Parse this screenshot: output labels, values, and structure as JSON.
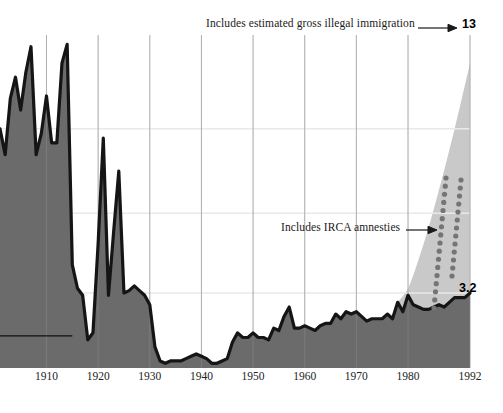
{
  "chart_data": {
    "type": "area",
    "title": "",
    "subtitle": "",
    "xlabel": "",
    "ylabel": "",
    "xlim": [
      1901,
      1992
    ],
    "ylim": [
      0,
      14.2
    ],
    "grid": true,
    "gridlines_y": [
      3.2,
      6.6,
      10.2
    ],
    "legend_position": "none",
    "tick_labels_x": [
      "1910",
      "1920",
      "1930",
      "1940",
      "1950",
      "1960",
      "1970",
      "1980",
      "1992"
    ],
    "tick_values_x": [
      1910,
      1920,
      1930,
      1940,
      1950,
      1960,
      1970,
      1980,
      1992
    ],
    "annotations": [
      {
        "text": "Includes estimated gross illegal immigration",
        "points_to": "13",
        "arrow": "right"
      },
      {
        "text": "Includes IRCA amnesties",
        "points_to": "dotted-band",
        "arrow": "right"
      }
    ],
    "value_labels": [
      {
        "text": "13",
        "series": "total_with_illegal",
        "x": 1992,
        "y": 13
      },
      {
        "text": "3.2",
        "series": "legal_immigration",
        "x": 1992,
        "y": 3.2
      }
    ],
    "series": [
      {
        "name": "legal_immigration",
        "style": "area-dark",
        "fill": "#6b6b6b",
        "stroke": "#151515",
        "x": [
          1901,
          1902,
          1903,
          1904,
          1905,
          1906,
          1907,
          1908,
          1909,
          1910,
          1911,
          1912,
          1913,
          1914,
          1915,
          1916,
          1917,
          1918,
          1919,
          1920,
          1921,
          1922,
          1923,
          1924,
          1925,
          1926,
          1927,
          1928,
          1929,
          1930,
          1931,
          1932,
          1933,
          1934,
          1935,
          1936,
          1937,
          1938,
          1939,
          1940,
          1941,
          1942,
          1943,
          1944,
          1945,
          1946,
          1947,
          1948,
          1949,
          1950,
          1951,
          1952,
          1953,
          1954,
          1955,
          1956,
          1957,
          1958,
          1959,
          1960,
          1961,
          1962,
          1963,
          1964,
          1965,
          1966,
          1967,
          1968,
          1969,
          1970,
          1971,
          1972,
          1973,
          1974,
          1975,
          1976,
          1977,
          1978,
          1979,
          1980,
          1981,
          1982,
          1983,
          1984,
          1985,
          1986,
          1987,
          1988,
          1989,
          1990,
          1991,
          1992
        ],
        "y": [
          10.2,
          9.1,
          11.5,
          12.4,
          11.0,
          12.6,
          13.7,
          9.1,
          10.0,
          11.6,
          9.6,
          9.6,
          13.0,
          13.8,
          4.4,
          3.4,
          3.1,
          1.2,
          1.5,
          5.3,
          9.8,
          3.1,
          5.8,
          8.4,
          3.2,
          3.3,
          3.5,
          3.3,
          3.1,
          2.7,
          0.9,
          0.3,
          0.2,
          0.3,
          0.3,
          0.3,
          0.4,
          0.5,
          0.6,
          0.5,
          0.4,
          0.2,
          0.2,
          0.3,
          0.4,
          1.1,
          1.5,
          1.3,
          1.3,
          1.5,
          1.3,
          1.3,
          1.2,
          1.7,
          1.6,
          2.2,
          2.6,
          1.7,
          1.7,
          1.8,
          1.7,
          1.6,
          1.8,
          1.9,
          1.9,
          2.3,
          2.1,
          2.4,
          2.3,
          2.4,
          2.2,
          2.0,
          2.1,
          2.1,
          2.1,
          2.3,
          2.1,
          2.8,
          2.4,
          3.1,
          2.7,
          2.6,
          2.5,
          2.5,
          2.6,
          2.7,
          2.6,
          2.8,
          3.0,
          3.0,
          3.0,
          3.2
        ]
      },
      {
        "name": "total_with_illegal",
        "style": "area-light-overlay",
        "fill": "#c9c9c9",
        "x": [
          1978,
          1980,
          1982,
          1984,
          1986,
          1988,
          1990,
          1992
        ],
        "y": [
          2.8,
          3.4,
          4.6,
          6.0,
          7.6,
          9.3,
          11.1,
          13.0
        ]
      },
      {
        "name": "irca_amnesty_band",
        "style": "dotted",
        "color": "#757575",
        "dot_radius": 2.6,
        "note": "two dotted tracks inside the light wedge"
      }
    ],
    "reference_line": {
      "name": "left-baseline-rule",
      "y": 3.2,
      "x_from": 1901,
      "x_to": 1915
    }
  },
  "labels": {
    "annotation_top": "Includes estimated gross illegal immigration",
    "annotation_irca": "Includes IRCA amnesties",
    "value_top": "13",
    "value_bottom": "3.2"
  },
  "axis": {
    "x_ticks": [
      {
        "label": "1910"
      },
      {
        "label": "1920"
      },
      {
        "label": "1930"
      },
      {
        "label": "1940"
      },
      {
        "label": "1950"
      },
      {
        "label": "1960"
      },
      {
        "label": "1970"
      },
      {
        "label": "1980"
      },
      {
        "label": "1992"
      }
    ]
  },
  "colors": {
    "dark_fill": "#6b6b6b",
    "dark_stroke": "#151515",
    "light_fill": "#c9c9c9",
    "dot_color": "#757575",
    "gridline": "#e9e9e9",
    "text": "#1a1a1a",
    "background": "#ffffff"
  }
}
